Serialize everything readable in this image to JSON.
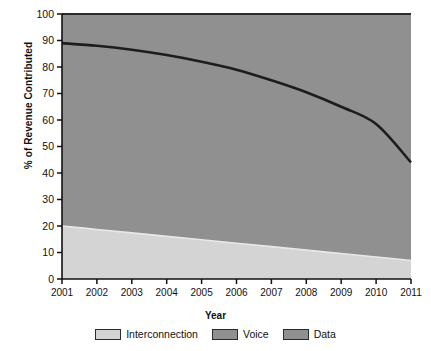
{
  "chart_data": {
    "type": "area",
    "title": "",
    "xlabel": "Year",
    "ylabel": "% of Revenue Contributed",
    "categories": [
      "2001",
      "2002",
      "2003",
      "2004",
      "2005",
      "2006",
      "2007",
      "2008",
      "2009",
      "2010",
      "2011"
    ],
    "x": [
      2001,
      2002,
      2003,
      2004,
      2005,
      2006,
      2007,
      2008,
      2009,
      2010,
      2011
    ],
    "xlim": [
      2001,
      2011
    ],
    "ylim": [
      0,
      100
    ],
    "ytick_labels": [
      "0",
      "10",
      "20",
      "30",
      "40",
      "50",
      "60",
      "70",
      "80",
      "90",
      "100"
    ],
    "yticks": [
      0,
      10,
      20,
      30,
      40,
      50,
      60,
      70,
      80,
      90,
      100
    ],
    "grid": false,
    "stacked": true,
    "legend_position": "bottom",
    "series": [
      {
        "name": "Interconnection",
        "color": "#d4d4d4",
        "values": [
          20.0,
          18.7,
          17.4,
          16.1,
          14.8,
          13.5,
          12.2,
          10.9,
          9.6,
          8.3,
          7.0
        ]
      },
      {
        "name": "Voice",
        "color": "#909090",
        "values": [
          69.0,
          67.0,
          64.8,
          62.0,
          58.7,
          54.0,
          48.5,
          42.5,
          36.0,
          29.5,
          37.0
        ]
      },
      {
        "name": "Data",
        "color": "#909090",
        "values": [
          11.0,
          14.3,
          17.8,
          21.9,
          26.5,
          32.5,
          39.3,
          46.6,
          54.4,
          62.2,
          56.0
        ]
      }
    ],
    "boundaries": {
      "interconnection_top": [
        20.0,
        18.7,
        17.4,
        16.1,
        14.8,
        13.5,
        12.2,
        10.9,
        9.6,
        8.3,
        7.0
      ],
      "voice_top": [
        89.0,
        88.0,
        86.5,
        84.5,
        82.0,
        79.0,
        75.0,
        70.5,
        65.0,
        58.5,
        44.0
      ],
      "total_top": [
        100,
        100,
        100,
        100,
        100,
        100,
        100,
        100,
        100,
        100,
        100
      ]
    },
    "annotations": []
  },
  "legend": {
    "items": [
      {
        "label": "Interconnection",
        "color": "#d4d4d4"
      },
      {
        "label": "Voice",
        "color": "#909090"
      },
      {
        "label": "Data",
        "color": "#909090"
      }
    ]
  }
}
